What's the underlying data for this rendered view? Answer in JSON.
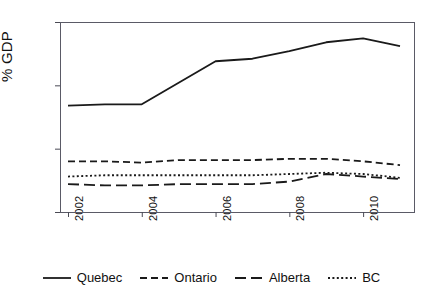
{
  "chart_data": {
    "type": "line",
    "title": "",
    "subtitle": "",
    "xlabel": "",
    "ylabel": "% GDP",
    "x": [
      2002,
      2003,
      2004,
      2005,
      2006,
      2007,
      2008,
      2009,
      2010,
      2011
    ],
    "xlim": [
      2002,
      2011
    ],
    "ylim": [
      0,
      1.5
    ],
    "xticks": [
      2002,
      2004,
      2006,
      2008,
      2010
    ],
    "xtick_labels": [
      "2002",
      "2004",
      "2006",
      "2008",
      "2010"
    ],
    "yticks": [
      0,
      0.5,
      1,
      1.5
    ],
    "ytick_labels": [
      "0",
      ".5",
      "1",
      "1.5"
    ],
    "grid": false,
    "legend_position": "bottom",
    "series": [
      {
        "name": "Quebec",
        "style": "solid",
        "color": "#1a1a1a",
        "values": [
          0.84,
          0.85,
          0.85,
          1.02,
          1.19,
          1.21,
          1.27,
          1.34,
          1.37,
          1.31
        ]
      },
      {
        "name": "Ontario",
        "style": "dashed",
        "color": "#1a1a1a",
        "values": [
          0.4,
          0.4,
          0.39,
          0.41,
          0.41,
          0.41,
          0.42,
          0.42,
          0.4,
          0.37
        ]
      },
      {
        "name": "Alberta",
        "style": "longdash",
        "color": "#1a1a1a",
        "values": [
          0.22,
          0.21,
          0.21,
          0.22,
          0.22,
          0.22,
          0.24,
          0.3,
          0.28,
          0.26
        ]
      },
      {
        "name": "BC",
        "style": "dotted",
        "color": "#1a1a1a",
        "values": [
          0.28,
          0.29,
          0.29,
          0.29,
          0.29,
          0.29,
          0.3,
          0.31,
          0.3,
          0.27
        ]
      }
    ]
  },
  "legend": {
    "items": [
      {
        "label": "Quebec",
        "style": "solid"
      },
      {
        "label": "Ontario",
        "style": "dashed"
      },
      {
        "label": "Alberta",
        "style": "longdash"
      },
      {
        "label": "BC",
        "style": "dotted"
      }
    ]
  }
}
